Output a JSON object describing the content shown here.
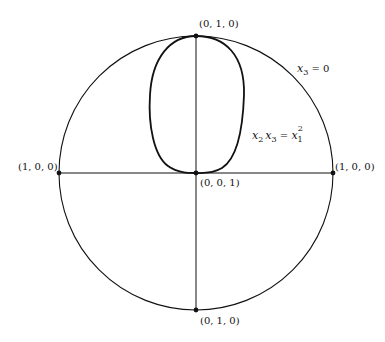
{
  "diagram": {
    "circle": {
      "cx": 196,
      "cy": 173,
      "r": 137
    },
    "points": {
      "top": {
        "label": "(0, 1, 0)",
        "x": 196,
        "y": 36
      },
      "bottom": {
        "label": "(0, 1, 0)",
        "x": 196,
        "y": 310
      },
      "left": {
        "label": "(1, 0, 0)",
        "x": 59,
        "y": 173
      },
      "right": {
        "label": "(1, 0, 0)",
        "x": 333,
        "y": 173
      },
      "center": {
        "label": "(0, 0, 1)",
        "x": 196,
        "y": 173
      }
    },
    "curve_labels": {
      "line_at_infinity": {
        "var": "x",
        "sub": "3",
        "rest": " = 0"
      },
      "conic": {
        "a": "x",
        "a_sub": "2",
        "b": "x",
        "b_sub": "3",
        "eq": " = ",
        "c": "x",
        "c_sub": "1",
        "c_sup": "2"
      }
    },
    "colors": {
      "stroke": "#111111",
      "background": "#ffffff"
    }
  }
}
